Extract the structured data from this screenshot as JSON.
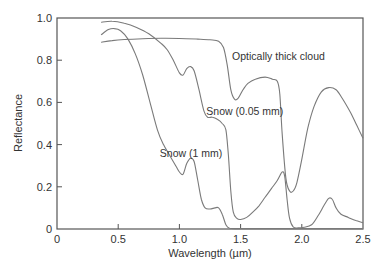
{
  "chart_data": {
    "type": "line",
    "title": "",
    "xlabel": "Wavelength (µm)",
    "ylabel": "Reflectance",
    "xlim": [
      0,
      2.5
    ],
    "ylim": [
      0,
      1.0
    ],
    "xticks": [
      0,
      0.5,
      1.0,
      1.5,
      2.0,
      2.5
    ],
    "xtick_labels": [
      "0",
      "0.5",
      "1.0",
      "1.5",
      "2.0",
      "2.5"
    ],
    "yticks": [
      0,
      0.2,
      0.4,
      0.6,
      0.8,
      1.0
    ],
    "ytick_labels": [
      "0",
      "0.2",
      "0.4",
      "0.6",
      "0.8",
      "1.0"
    ],
    "grid": false,
    "legend": "none (inline annotations)",
    "series": [
      {
        "name": "Snow (0.05 mm)",
        "label_pos": [
          1.22,
          0.54
        ],
        "points": [
          [
            0.36,
            0.98
          ],
          [
            0.45,
            0.985
          ],
          [
            0.55,
            0.975
          ],
          [
            0.65,
            0.955
          ],
          [
            0.75,
            0.925
          ],
          [
            0.85,
            0.88
          ],
          [
            0.9,
            0.85
          ],
          [
            0.95,
            0.8
          ],
          [
            1.0,
            0.74
          ],
          [
            1.03,
            0.73
          ],
          [
            1.06,
            0.76
          ],
          [
            1.09,
            0.77
          ],
          [
            1.12,
            0.75
          ],
          [
            1.16,
            0.66
          ],
          [
            1.2,
            0.56
          ],
          [
            1.23,
            0.53
          ],
          [
            1.27,
            0.53
          ],
          [
            1.31,
            0.52
          ],
          [
            1.35,
            0.5
          ],
          [
            1.38,
            0.47
          ],
          [
            1.4,
            0.35
          ],
          [
            1.42,
            0.18
          ],
          [
            1.44,
            0.08
          ],
          [
            1.47,
            0.05
          ],
          [
            1.5,
            0.045
          ],
          [
            1.55,
            0.055
          ],
          [
            1.6,
            0.08
          ],
          [
            1.65,
            0.11
          ],
          [
            1.7,
            0.15
          ],
          [
            1.75,
            0.19
          ],
          [
            1.8,
            0.23
          ],
          [
            1.84,
            0.27
          ],
          [
            1.86,
            0.25
          ],
          [
            1.88,
            0.14
          ],
          [
            1.9,
            0.05
          ],
          [
            1.93,
            0.01
          ],
          [
            1.97,
            0.005
          ],
          [
            2.02,
            0.008
          ],
          [
            2.08,
            0.02
          ],
          [
            2.13,
            0.06
          ],
          [
            2.18,
            0.11
          ],
          [
            2.22,
            0.145
          ],
          [
            2.25,
            0.14
          ],
          [
            2.28,
            0.1
          ],
          [
            2.32,
            0.07
          ],
          [
            2.38,
            0.055
          ],
          [
            2.44,
            0.04
          ],
          [
            2.5,
            0.03
          ]
        ]
      },
      {
        "name": "Snow (1 mm)",
        "label_pos": [
          0.84,
          0.34
        ],
        "points": [
          [
            0.36,
            0.92
          ],
          [
            0.42,
            0.945
          ],
          [
            0.47,
            0.95
          ],
          [
            0.52,
            0.94
          ],
          [
            0.58,
            0.9
          ],
          [
            0.64,
            0.83
          ],
          [
            0.7,
            0.73
          ],
          [
            0.76,
            0.6
          ],
          [
            0.82,
            0.47
          ],
          [
            0.87,
            0.4
          ],
          [
            0.92,
            0.35
          ],
          [
            0.97,
            0.3
          ],
          [
            1.0,
            0.27
          ],
          [
            1.03,
            0.26
          ],
          [
            1.06,
            0.31
          ],
          [
            1.09,
            0.335
          ],
          [
            1.12,
            0.32
          ],
          [
            1.15,
            0.23
          ],
          [
            1.18,
            0.14
          ],
          [
            1.21,
            0.1
          ],
          [
            1.25,
            0.095
          ],
          [
            1.29,
            0.1
          ],
          [
            1.32,
            0.1
          ],
          [
            1.35,
            0.07
          ],
          [
            1.38,
            0.02
          ],
          [
            1.41,
            0.004
          ],
          [
            1.5,
            0.002
          ],
          [
            1.8,
            0.002
          ],
          [
            2.0,
            0.002
          ],
          [
            2.5,
            0.002
          ]
        ]
      },
      {
        "name": "Optically thick cloud",
        "label_pos": [
          1.43,
          0.8
        ],
        "points": [
          [
            0.36,
            0.885
          ],
          [
            0.45,
            0.893
          ],
          [
            0.55,
            0.898
          ],
          [
            0.7,
            0.902
          ],
          [
            0.85,
            0.904
          ],
          [
            1.0,
            0.903
          ],
          [
            1.15,
            0.9
          ],
          [
            1.25,
            0.897
          ],
          [
            1.32,
            0.89
          ],
          [
            1.36,
            0.86
          ],
          [
            1.39,
            0.78
          ],
          [
            1.42,
            0.66
          ],
          [
            1.45,
            0.615
          ],
          [
            1.48,
            0.62
          ],
          [
            1.52,
            0.66
          ],
          [
            1.56,
            0.69
          ],
          [
            1.62,
            0.71
          ],
          [
            1.7,
            0.72
          ],
          [
            1.76,
            0.71
          ],
          [
            1.8,
            0.7
          ],
          [
            1.82,
            0.64
          ],
          [
            1.84,
            0.45
          ],
          [
            1.87,
            0.24
          ],
          [
            1.9,
            0.18
          ],
          [
            1.93,
            0.18
          ],
          [
            1.96,
            0.22
          ],
          [
            2.0,
            0.33
          ],
          [
            2.05,
            0.48
          ],
          [
            2.1,
            0.58
          ],
          [
            2.16,
            0.65
          ],
          [
            2.22,
            0.67
          ],
          [
            2.28,
            0.66
          ],
          [
            2.33,
            0.62
          ],
          [
            2.4,
            0.55
          ],
          [
            2.45,
            0.49
          ],
          [
            2.5,
            0.43
          ]
        ]
      }
    ]
  }
}
